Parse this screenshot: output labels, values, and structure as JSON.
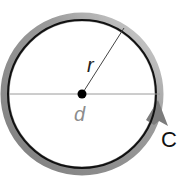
{
  "diagram": {
    "labels": {
      "radius": "r",
      "diameter": "d",
      "circumference": "C"
    },
    "colors": {
      "circle_outline": "#111111",
      "circumference_band": "#8a8a8a",
      "circumference_band_light": "#c8c8c8",
      "radius_line": "#444444",
      "diameter_line": "#9a9a9a",
      "center_point": "#000000",
      "diameter_label": "#8c8c8c",
      "radius_label": "#222222",
      "circumference_label": "#111111"
    }
  }
}
